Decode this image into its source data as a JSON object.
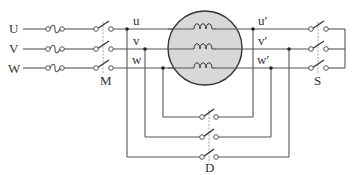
{
  "diagram": {
    "type": "three-phase motor connection circuit",
    "supply_labels": [
      "U",
      "V",
      "W"
    ],
    "motor_terminal_labels": [
      "u",
      "v",
      "w"
    ],
    "motor_terminal_prime_labels": [
      "u′",
      "v′",
      "w′"
    ],
    "switches": {
      "main": "M",
      "star": "S",
      "delta": "D"
    },
    "colors": {
      "motor_fill": "#d8d8d8",
      "line": "#555555"
    }
  }
}
